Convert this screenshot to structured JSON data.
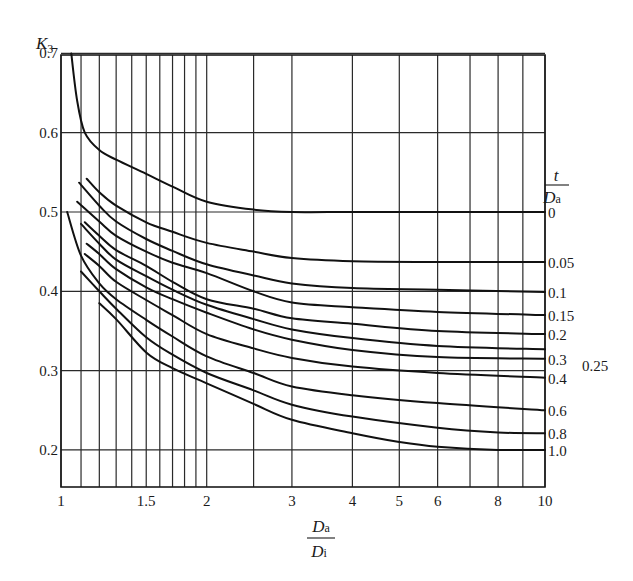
{
  "chart_data": {
    "type": "line",
    "title": "",
    "xlabel": "Da/Di",
    "xlabel_parts": {
      "numerator": "D",
      "numerator_sub": "a",
      "denominator": "D",
      "denominator_sub": "i"
    },
    "ylabel": "K3",
    "ylabel_parts": {
      "main": "K",
      "sub": "3"
    },
    "legend_title": "t/Da",
    "legend_title_parts": {
      "numerator": "t",
      "denominator": "D",
      "denominator_sub": "a"
    },
    "legend_position": "right, labels at curve ends",
    "x_scale": "log",
    "xlim": [
      1,
      10
    ],
    "ylim": [
      0.153,
      0.7
    ],
    "grid": true,
    "x_gridlines": [
      1,
      1.1,
      1.2,
      1.3,
      1.4,
      1.5,
      1.6,
      1.7,
      1.8,
      1.9,
      2,
      2.5,
      3,
      4,
      5,
      6,
      7,
      8,
      9,
      10
    ],
    "y_gridlines": [
      0.2,
      0.3,
      0.4,
      0.5,
      0.6,
      0.7
    ],
    "x_tick_labels": [
      {
        "value": 1,
        "label": "1"
      },
      {
        "value": 1.5,
        "label": "1.5"
      },
      {
        "value": 2,
        "label": "2"
      },
      {
        "value": 3,
        "label": "3"
      },
      {
        "value": 4,
        "label": "4"
      },
      {
        "value": 5,
        "label": "5"
      },
      {
        "value": 6,
        "label": "6"
      },
      {
        "value": 8,
        "label": "8"
      },
      {
        "value": 10,
        "label": "10"
      }
    ],
    "y_tick_labels": [
      {
        "value": 0.2,
        "label": "0.2"
      },
      {
        "value": 0.3,
        "label": "0.3"
      },
      {
        "value": 0.4,
        "label": "0.4"
      },
      {
        "value": 0.5,
        "label": "0.5"
      },
      {
        "value": 0.6,
        "label": "0.6"
      },
      {
        "value": 0.7,
        "label": "0.7"
      }
    ],
    "series": [
      {
        "name": "0",
        "label": "0",
        "label_dx": 0,
        "label_dy": 0,
        "points": [
          [
            1.05,
            0.7
          ],
          [
            1.08,
            0.64
          ],
          [
            1.12,
            0.6
          ],
          [
            1.2,
            0.578
          ],
          [
            1.3,
            0.566
          ],
          [
            1.5,
            0.548
          ],
          [
            1.7,
            0.532
          ],
          [
            2,
            0.513
          ],
          [
            2.5,
            0.503
          ],
          [
            3,
            0.5
          ],
          [
            4,
            0.5
          ],
          [
            6,
            0.5
          ],
          [
            10,
            0.5
          ]
        ]
      },
      {
        "name": "0.05",
        "label": "0.05",
        "label_dx": 0,
        "label_dy": 0,
        "points": [
          [
            1.13,
            0.542
          ],
          [
            1.2,
            0.525
          ],
          [
            1.3,
            0.508
          ],
          [
            1.5,
            0.487
          ],
          [
            1.7,
            0.475
          ],
          [
            2,
            0.461
          ],
          [
            2.5,
            0.45
          ],
          [
            3,
            0.442
          ],
          [
            4,
            0.438
          ],
          [
            6,
            0.437
          ],
          [
            10,
            0.437
          ]
        ]
      },
      {
        "name": "0.1",
        "label": "0.1",
        "label_dx": 0,
        "label_dy": 0,
        "points": [
          [
            1.09,
            0.537
          ],
          [
            1.2,
            0.508
          ],
          [
            1.3,
            0.488
          ],
          [
            1.5,
            0.466
          ],
          [
            1.7,
            0.451
          ],
          [
            2,
            0.434
          ],
          [
            2.5,
            0.42
          ],
          [
            3,
            0.41
          ],
          [
            4,
            0.404
          ],
          [
            6,
            0.402
          ],
          [
            10,
            0.399
          ]
        ]
      },
      {
        "name": "0.15",
        "label": "0.15",
        "label_dx": 0,
        "label_dy": 0,
        "points": [
          [
            1.08,
            0.513
          ],
          [
            1.2,
            0.488
          ],
          [
            1.3,
            0.47
          ],
          [
            1.5,
            0.45
          ],
          [
            1.7,
            0.436
          ],
          [
            2,
            0.423
          ],
          [
            2.5,
            0.4
          ],
          [
            3,
            0.386
          ],
          [
            4,
            0.38
          ],
          [
            6,
            0.374
          ],
          [
            10,
            0.37
          ]
        ]
      },
      {
        "name": "0.2",
        "label": "0.2",
        "label_dx": 0,
        "label_dy": 0,
        "points": [
          [
            1.12,
            0.487
          ],
          [
            1.2,
            0.47
          ],
          [
            1.3,
            0.452
          ],
          [
            1.5,
            0.432
          ],
          [
            1.7,
            0.412
          ],
          [
            2,
            0.39
          ],
          [
            2.5,
            0.378
          ],
          [
            3,
            0.366
          ],
          [
            4,
            0.359
          ],
          [
            6,
            0.35
          ],
          [
            10,
            0.346
          ]
        ]
      },
      {
        "name": "0.25",
        "label": "0.25",
        "label_dx": 34,
        "label_dy": 16,
        "points": [
          [
            1.1,
            0.485
          ],
          [
            1.2,
            0.46
          ],
          [
            1.3,
            0.44
          ],
          [
            1.5,
            0.419
          ],
          [
            1.7,
            0.402
          ],
          [
            2,
            0.383
          ],
          [
            2.5,
            0.365
          ],
          [
            3,
            0.352
          ],
          [
            4,
            0.341
          ],
          [
            6,
            0.331
          ],
          [
            10,
            0.327
          ]
        ]
      },
      {
        "name": "0.3",
        "label": "0.3",
        "label_dx": 0,
        "label_dy": 0,
        "points": [
          [
            1.13,
            0.46
          ],
          [
            1.2,
            0.447
          ],
          [
            1.3,
            0.428
          ],
          [
            1.5,
            0.405
          ],
          [
            1.7,
            0.39
          ],
          [
            2,
            0.373
          ],
          [
            2.5,
            0.352
          ],
          [
            3,
            0.339
          ],
          [
            4,
            0.326
          ],
          [
            6,
            0.317
          ],
          [
            10,
            0.315
          ]
        ]
      },
      {
        "name": "0.4",
        "label": "0.4",
        "label_dx": 0,
        "label_dy": 0,
        "points": [
          [
            1.12,
            0.447
          ],
          [
            1.2,
            0.432
          ],
          [
            1.3,
            0.412
          ],
          [
            1.5,
            0.389
          ],
          [
            1.7,
            0.37
          ],
          [
            2,
            0.346
          ],
          [
            2.5,
            0.328
          ],
          [
            3,
            0.316
          ],
          [
            4,
            0.305
          ],
          [
            6,
            0.297
          ],
          [
            10,
            0.291
          ]
        ]
      },
      {
        "name": "0.6",
        "label": "0.6",
        "label_dx": 0,
        "label_dy": 0,
        "points": [
          [
            1.03,
            0.5
          ],
          [
            1.1,
            0.445
          ],
          [
            1.2,
            0.41
          ],
          [
            1.3,
            0.39
          ],
          [
            1.5,
            0.364
          ],
          [
            1.7,
            0.343
          ],
          [
            2,
            0.318
          ],
          [
            2.5,
            0.297
          ],
          [
            3,
            0.28
          ],
          [
            4,
            0.269
          ],
          [
            6,
            0.259
          ],
          [
            10,
            0.25
          ]
        ]
      },
      {
        "name": "0.8",
        "label": "0.8",
        "label_dx": 0,
        "label_dy": 0,
        "points": [
          [
            1.1,
            0.425
          ],
          [
            1.2,
            0.4
          ],
          [
            1.3,
            0.378
          ],
          [
            1.5,
            0.342
          ],
          [
            1.7,
            0.32
          ],
          [
            2,
            0.297
          ],
          [
            2.5,
            0.275
          ],
          [
            3,
            0.257
          ],
          [
            4,
            0.242
          ],
          [
            6,
            0.228
          ],
          [
            8,
            0.222
          ],
          [
            10,
            0.221
          ]
        ]
      },
      {
        "name": "1.0",
        "label": "1.0",
        "label_dx": 0,
        "label_dy": 0,
        "points": [
          [
            1.2,
            0.385
          ],
          [
            1.3,
            0.365
          ],
          [
            1.5,
            0.323
          ],
          [
            1.7,
            0.303
          ],
          [
            2,
            0.284
          ],
          [
            2.5,
            0.258
          ],
          [
            3,
            0.238
          ],
          [
            4,
            0.221
          ],
          [
            5,
            0.21
          ],
          [
            6,
            0.204
          ],
          [
            8,
            0.2
          ],
          [
            10,
            0.2
          ]
        ]
      }
    ]
  }
}
